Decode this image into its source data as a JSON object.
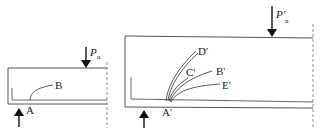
{
  "diagram": {
    "colors": {
      "line": "#333333",
      "dash": "#666666",
      "background": "#ffffff"
    },
    "beam_small": {
      "load_label": "P",
      "load_subscript": "u",
      "points": [
        {
          "id": "A",
          "label": "A"
        },
        {
          "id": "B",
          "label": "B"
        }
      ]
    },
    "beam_large": {
      "load_label": "P′",
      "load_subscript": "u",
      "points": [
        {
          "id": "A'",
          "label": "A'"
        },
        {
          "id": "B'",
          "label": "B'"
        },
        {
          "id": "C'",
          "label": "C'"
        },
        {
          "id": "D'",
          "label": "D'"
        },
        {
          "id": "E'",
          "label": "E'"
        }
      ]
    }
  }
}
